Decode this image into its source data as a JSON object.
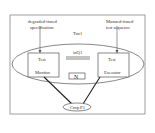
{
  "diagram": {
    "top_left_label": [
      "degraded-timed",
      "specification"
    ],
    "top_right_label": [
      "Mutated-timed",
      "test sequence"
    ],
    "tester_label": "Tstr1",
    "queue_label": "ioQ1",
    "monitor_box": [
      "Test",
      "Monitor"
    ],
    "executor_box": [
      "Test",
      "Executor"
    ],
    "middle_box_symbol": "N",
    "component_label": "Cmp P1",
    "colors": {
      "stroke": "#555555",
      "background": "#ffffff",
      "text": "#333333"
    }
  }
}
